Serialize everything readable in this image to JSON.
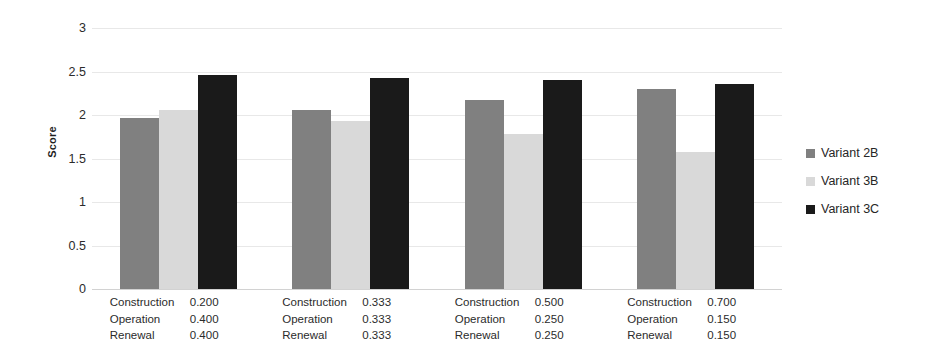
{
  "chart_data": {
    "type": "bar",
    "title": "",
    "subtitle": "",
    "xlabel": "",
    "ylabel": "Score",
    "ylim": [
      0,
      3
    ],
    "ytick_values": [
      0,
      0.5,
      1,
      1.5,
      2,
      2.5,
      3
    ],
    "ytick_labels": [
      "0",
      "0.5",
      "1",
      "1.5",
      "2",
      "2.5",
      "3"
    ],
    "grid": true,
    "legend_position": "right",
    "categories": [
      "Group 1",
      "Group 2",
      "Group 3",
      "Group 4"
    ],
    "series": [
      {
        "name": "Variant 2B",
        "color": "#808080",
        "values": [
          1.97,
          2.06,
          2.17,
          2.3
        ]
      },
      {
        "name": "Variant 3B",
        "color": "#d9d9d9",
        "values": [
          2.06,
          1.93,
          1.78,
          1.58
        ]
      },
      {
        "name": "Variant 3C",
        "color": "#1a1a1a",
        "values": [
          2.46,
          2.43,
          2.4,
          2.36
        ]
      }
    ],
    "category_detail_rows": [
      "Construction",
      "Operation",
      "Renewal"
    ],
    "category_details": [
      {
        "Construction": "0.200",
        "Operation": "0.400",
        "Renewal": "0.400"
      },
      {
        "Construction": "0.333",
        "Operation": "0.333",
        "Renewal": "0.333"
      },
      {
        "Construction": "0.500",
        "Operation": "0.250",
        "Renewal": "0.250"
      },
      {
        "Construction": "0.700",
        "Operation": "0.150",
        "Renewal": "0.150"
      }
    ]
  },
  "axis": {
    "y_title": "Score"
  },
  "legend": {
    "items": [
      {
        "label": "Variant 2B",
        "color": "#808080"
      },
      {
        "label": "Variant 3B",
        "color": "#d9d9d9"
      },
      {
        "label": "Variant 3C",
        "color": "#1a1a1a"
      }
    ]
  }
}
